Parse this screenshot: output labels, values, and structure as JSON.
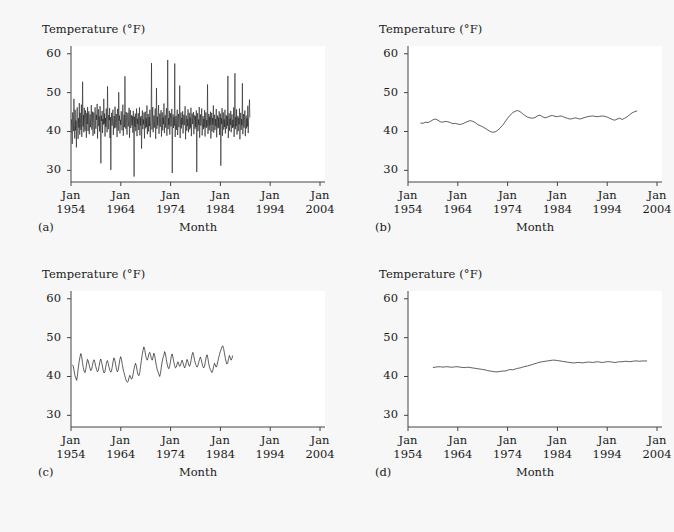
{
  "figure": {
    "background": "#f7f7f7",
    "plot_background": "#ffffff",
    "line_color": "#1a1a1a"
  },
  "axes": {
    "ylabel": "Temperature (°F)",
    "xlabel": "Month",
    "yticks": [
      30,
      40,
      50,
      60
    ],
    "ytick_labels": [
      "30",
      "40",
      "50",
      "60"
    ],
    "ylim": [
      27,
      62
    ],
    "xtick_labels": [
      {
        "month": "Jan",
        "year": "1954"
      },
      {
        "month": "Jan",
        "year": "1964"
      },
      {
        "month": "Jan",
        "year": "1974"
      },
      {
        "month": "Jan",
        "year": "1984"
      },
      {
        "month": "Jan",
        "year": "1994"
      },
      {
        "month": "Jan",
        "year": "2004"
      }
    ],
    "xlim": [
      1954,
      2005
    ]
  },
  "panels": [
    {
      "tag": "(a)",
      "id": "panel-a"
    },
    {
      "tag": "(b)",
      "id": "panel-b"
    },
    {
      "tag": "(c)",
      "id": "panel-c"
    },
    {
      "tag": "(d)",
      "id": "panel-d"
    }
  ],
  "chart_data": [
    {
      "type": "line",
      "panel": "(a)",
      "title": "",
      "xlabel": "Month",
      "ylabel": "Temperature (°F)",
      "xlim": [
        1954,
        2005
      ],
      "ylim": [
        27,
        62
      ],
      "grid": false,
      "legend": "none",
      "description": "Raw monthly average temperature series, unsmoothed",
      "smoothing_months": 1,
      "x_start": 1954.0,
      "x_step": 0.08333,
      "y_range_observed": [
        29.2,
        58.5
      ],
      "values": [
        39.6,
        43.1,
        41.2,
        36.8,
        44.9,
        42.3,
        40.1,
        48.4,
        41.7,
        38.2,
        45.6,
        40.3,
        42.8,
        35.9,
        44.1,
        46.2,
        40.7,
        38.1,
        43.4,
        41.0,
        47.3,
        39.2,
        44.8,
        42.1,
        40.4,
        46.9,
        38.6,
        43.7,
        52.8,
        41.3,
        44.2,
        39.8,
        46.1,
        42.6,
        40.2,
        45.4,
        43.1,
        38.4,
        44.7,
        41.9,
        46.3,
        40.1,
        43.8,
        45.2,
        39.3,
        42.7,
        44.4,
        41.1,
        43.6,
        46.8,
        40.5,
        42.2,
        45.1,
        38.9,
        43.3,
        44.9,
        41.6,
        39.4,
        46.2,
        42.8,
        40.7,
        44.3,
        43.0,
        47.1,
        38.2,
        42.5,
        45.7,
        41.4,
        43.9,
        40.0,
        46.5,
        42.3,
        31.8,
        44.1,
        42.7,
        45.3,
        39.6,
        43.2,
        41.8,
        48.4,
        42.0,
        44.6,
        38.7,
        43.5,
        41.2,
        45.9,
        42.4,
        39.8,
        51.6,
        43.1,
        40.6,
        44.2,
        42.9,
        46.0,
        38.3,
        43.7,
        30.1,
        42.1,
        44.8,
        41.5,
        43.3,
        45.6,
        39.1,
        42.6,
        44.0,
        40.8,
        46.4,
        43.2,
        41.0,
        44.5,
        42.3,
        38.6,
        45.8,
        43.4,
        40.2,
        50.1,
        42.8,
        44.1,
        39.5,
        43.0,
        41.7,
        45.2,
        42.6,
        40.3,
        43.8,
        46.9,
        38.9,
        42.4,
        44.3,
        41.1,
        54.2,
        43.6,
        40.7,
        45.0,
        42.2,
        39.2,
        43.5,
        44.8,
        41.3,
        42.9,
        46.1,
        38.4,
        43.1,
        45.5,
        40.9,
        42.7,
        44.2,
        41.6,
        43.9,
        39.7,
        45.3,
        42.0,
        28.4,
        43.8,
        41.2,
        44.6,
        40.1,
        42.5,
        45.9,
        38.8,
        43.3,
        41.9,
        44.7,
        40.4,
        42.8,
        46.2,
        39.0,
        43.6,
        41.5,
        44.0,
        35.6,
        42.3,
        45.4,
        40.6,
        43.1,
        41.8,
        44.9,
        38.2,
        42.6,
        45.1,
        40.8,
        43.4,
        41.2,
        46.7,
        39.3,
        42.9,
        44.5,
        40.0,
        43.7,
        41.4,
        45.6,
        38.5,
        42.2,
        44.8,
        57.6,
        40.5,
        43.0,
        46.3,
        39.8,
        42.7,
        44.1,
        41.0,
        43.5,
        45.9,
        38.1,
        42.4,
        51.2,
        40.7,
        43.8,
        41.6,
        44.3,
        46.8,
        39.4,
        42.0,
        44.6,
        41.2,
        43.2,
        45.5,
        38.7,
        42.8,
        44.9,
        40.3,
        43.6,
        41.9,
        47.2,
        39.6,
        42.5,
        44.2,
        41.0,
        43.9,
        46.0,
        38.9,
        42.3,
        58.4,
        40.6,
        43.4,
        41.7,
        45.3,
        39.2,
        42.9,
        44.7,
        41.3,
        43.1,
        45.8,
        29.3,
        42.6,
        44.4,
        40.9,
        43.7,
        41.5,
        57.5,
        38.6,
        42.1,
        44.0,
        40.4,
        43.3,
        45.6,
        39.1,
        42.8,
        44.5,
        41.1,
        43.0,
        51.8,
        38.3,
        42.7,
        44.9,
        40.8,
        43.5,
        41.8,
        45.2,
        39.5,
        42.4,
        44.3,
        41.6,
        43.8,
        46.5,
        38.0,
        42.9,
        44.1,
        40.2,
        43.2,
        41.4,
        45.7,
        39.8,
        42.6,
        44.8,
        40.5,
        43.6,
        41.0,
        46.1,
        38.8,
        42.2,
        44.6,
        41.9,
        43.4,
        45.0,
        39.3,
        42.8,
        44.2,
        40.7,
        43.9,
        41.2,
        45.4,
        29.6,
        42.5,
        44.7,
        40.1,
        43.1,
        41.7,
        46.3,
        38.4,
        42.0,
        44.4,
        41.5,
        43.7,
        45.9,
        39.0,
        42.3,
        44.0,
        40.6,
        43.3,
        41.1,
        45.5,
        38.7,
        42.7,
        44.9,
        40.9,
        43.0,
        41.3,
        52.1,
        39.4,
        42.1,
        44.5,
        40.3,
        43.8,
        41.6,
        45.1,
        38.2,
        42.4,
        44.8,
        40.0,
        43.5,
        41.8,
        46.7,
        39.7,
        42.9,
        44.3,
        40.4,
        43.2,
        41.4,
        45.8,
        38.5,
        42.6,
        44.1,
        40.8,
        43.6,
        41.0,
        45.2,
        39.1,
        42.2,
        44.6,
        31.2,
        43.4,
        41.9,
        46.0,
        38.9,
        42.8,
        44.9,
        40.5,
        43.1,
        41.2,
        45.6,
        39.5,
        42.5,
        44.2,
        40.7,
        43.9,
        41.5,
        54.3,
        38.3,
        42.1,
        44.7,
        40.2,
        43.3,
        41.7,
        45.3,
        39.8,
        42.7,
        44.4,
        40.9,
        43.0,
        41.1,
        46.2,
        38.6,
        42.3,
        55.0,
        40.6,
        43.7,
        41.4,
        45.7,
        39.2,
        42.9,
        44.0,
        40.1,
        43.5,
        41.8,
        45.9,
        38.0,
        42.6,
        44.8,
        40.4,
        43.2,
        41.6,
        52.4,
        39.3,
        42.0,
        44.5,
        41.0,
        43.8,
        45.4,
        38.8,
        42.4,
        44.1,
        40.8,
        43.4,
        41.3,
        46.6,
        39.6,
        42.8,
        44.9,
        48.2,
        43.6
      ]
    },
    {
      "type": "line",
      "panel": "(b)",
      "title": "",
      "xlabel": "Month",
      "ylabel": "Temperature (°F)",
      "xlim": [
        1954,
        2005
      ],
      "ylim": [
        27,
        62
      ],
      "grid": false,
      "legend": "none",
      "description": "Strongly smoothed trend of the monthly temperature series",
      "smoothing_months": 61,
      "x_start": 1956.5,
      "x_step": 0.5,
      "y_range_observed": [
        39.8,
        45.4
      ],
      "values": [
        42.2,
        42.1,
        42.4,
        42.3,
        42.6,
        43.0,
        43.2,
        42.9,
        42.5,
        42.4,
        42.6,
        42.5,
        42.3,
        42.0,
        42.1,
        41.9,
        41.8,
        42.0,
        42.3,
        42.6,
        42.8,
        42.6,
        42.3,
        41.8,
        41.5,
        41.2,
        40.8,
        40.4,
        40.0,
        39.8,
        39.9,
        40.3,
        40.9,
        41.6,
        42.5,
        43.4,
        44.2,
        44.8,
        45.2,
        45.4,
        45.1,
        44.6,
        44.1,
        43.7,
        43.5,
        43.4,
        43.6,
        44.0,
        44.2,
        43.8,
        43.5,
        43.7,
        44.0,
        44.1,
        43.9,
        43.8,
        44.0,
        43.9,
        43.6,
        43.4,
        43.2,
        43.3,
        43.5,
        43.4,
        43.2,
        43.4,
        43.6,
        43.8,
        43.9,
        44.0,
        43.9,
        43.8,
        43.9,
        44.0,
        43.9,
        43.7,
        43.4,
        43.1,
        42.9,
        43.2,
        43.4,
        43.1,
        43.4,
        43.8,
        44.3,
        44.8,
        45.1,
        45.3
      ]
    },
    {
      "type": "line",
      "panel": "(c)",
      "title": "",
      "xlabel": "Month",
      "ylabel": "Temperature (°F)",
      "xlim": [
        1954,
        2005
      ],
      "ylim": [
        27,
        62
      ],
      "grid": false,
      "legend": "none",
      "description": "Moderately smoothed monthly temperature series",
      "smoothing_months": 7,
      "x_start": 1954.3,
      "x_step": 0.1667,
      "y_range_observed": [
        38.4,
        48.0
      ],
      "values": [
        43.0,
        42.6,
        41.4,
        40.2,
        39.6,
        39.0,
        40.4,
        42.2,
        43.8,
        45.0,
        45.9,
        45.2,
        43.6,
        42.3,
        41.4,
        41.0,
        41.8,
        43.2,
        44.4,
        44.0,
        43.0,
        42.2,
        41.5,
        41.8,
        42.8,
        43.9,
        44.3,
        43.6,
        42.6,
        41.8,
        41.2,
        41.5,
        42.6,
        43.8,
        44.5,
        43.8,
        42.7,
        41.6,
        40.9,
        41.2,
        42.4,
        43.6,
        44.1,
        43.4,
        42.4,
        41.6,
        41.1,
        41.4,
        42.6,
        44.0,
        44.8,
        44.2,
        43.0,
        41.9,
        41.2,
        41.6,
        42.9,
        44.3,
        45.1,
        44.4,
        43.1,
        41.9,
        41.0,
        40.2,
        39.4,
        38.8,
        38.5,
        38.7,
        39.6,
        40.3,
        39.8,
        39.3,
        39.6,
        40.6,
        41.8,
        42.8,
        43.4,
        42.6,
        41.3,
        40.4,
        40.2,
        41.0,
        42.6,
        44.2,
        45.6,
        46.8,
        47.6,
        46.9,
        45.6,
        44.6,
        44.2,
        44.8,
        45.8,
        46.2,
        45.6,
        44.6,
        44.2,
        45.0,
        46.0,
        45.4,
        44.0,
        42.8,
        41.8,
        41.2,
        40.6,
        40.0,
        40.8,
        42.4,
        43.8,
        44.8,
        45.4,
        46.4,
        45.8,
        44.4,
        43.2,
        42.4,
        42.0,
        42.6,
        43.8,
        45.2,
        45.8,
        45.0,
        43.8,
        42.8,
        42.2,
        42.4,
        43.2,
        43.8,
        43.2,
        42.6,
        42.8,
        43.6,
        44.2,
        43.6,
        42.8,
        42.2,
        42.6,
        43.6,
        44.4,
        43.8,
        43.0,
        42.6,
        43.2,
        44.4,
        45.6,
        46.2,
        45.4,
        44.2,
        43.4,
        42.8,
        42.4,
        42.8,
        43.6,
        44.4,
        45.0,
        44.4,
        43.4,
        42.6,
        42.2,
        42.6,
        43.8,
        45.0,
        45.6,
        44.8,
        43.4,
        42.4,
        41.8,
        41.4,
        41.0,
        41.6,
        42.6,
        43.4,
        43.0,
        42.4,
        42.8,
        43.8,
        44.8,
        45.6,
        46.4,
        47.0,
        47.6,
        47.9,
        47.2,
        46.0,
        44.8,
        43.8,
        43.2,
        43.6,
        44.6,
        45.4,
        44.8,
        44.2,
        44.6,
        45.4
      ]
    },
    {
      "type": "line",
      "panel": "(d)",
      "title": "",
      "xlabel": "Month",
      "ylabel": "Temperature (°F)",
      "xlim": [
        1954,
        2005
      ],
      "ylim": [
        27,
        62
      ],
      "grid": false,
      "legend": "none",
      "description": "Most heavily smoothed long-run trend of the temperature series",
      "smoothing_months": 121,
      "x_start": 1959.0,
      "x_step": 0.5,
      "y_range_observed": [
        41.2,
        44.2
      ],
      "values": [
        42.3,
        42.4,
        42.5,
        42.5,
        42.4,
        42.5,
        42.5,
        42.4,
        42.4,
        42.5,
        42.5,
        42.4,
        42.3,
        42.3,
        42.4,
        42.3,
        42.2,
        42.1,
        42.0,
        41.9,
        41.8,
        41.7,
        41.5,
        41.4,
        41.3,
        41.2,
        41.2,
        41.3,
        41.4,
        41.4,
        41.6,
        41.8,
        41.7,
        41.9,
        42.1,
        42.2,
        42.4,
        42.6,
        42.7,
        42.9,
        43.1,
        43.3,
        43.5,
        43.7,
        43.8,
        43.9,
        44.0,
        44.1,
        44.2,
        44.2,
        44.1,
        44.0,
        43.9,
        43.8,
        43.7,
        43.6,
        43.5,
        43.5,
        43.6,
        43.6,
        43.5,
        43.6,
        43.7,
        43.7,
        43.6,
        43.7,
        43.8,
        43.7,
        43.6,
        43.7,
        43.8,
        43.8,
        43.7,
        43.6,
        43.7,
        43.8,
        43.8,
        43.9,
        43.9,
        43.8,
        43.9,
        44.0,
        44.0,
        43.9,
        44.0,
        44.0,
        44.0
      ]
    }
  ]
}
